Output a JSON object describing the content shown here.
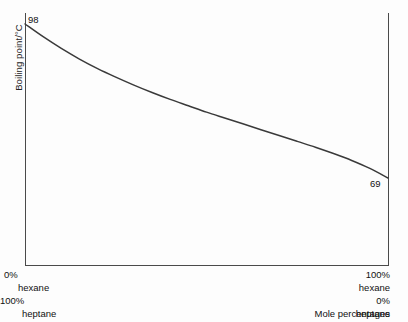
{
  "chart_data": {
    "type": "line",
    "title": "",
    "subtitle": "",
    "ylabel": "Boiling point/°C",
    "xlabel": "Mole percentages",
    "grid": false,
    "legend": null,
    "xlim": [
      0,
      100
    ],
    "ylim": [
      69,
      98
    ],
    "series": [
      {
        "name": "Boiling point of hexane-heptane mixture",
        "x": [
          0,
          5,
          10,
          15,
          20,
          25,
          30,
          35,
          40,
          45,
          50,
          55,
          60,
          65,
          70,
          75,
          80,
          85,
          90,
          95,
          100
        ],
        "y": [
          98.0,
          95.6,
          93.4,
          91.4,
          89.6,
          88.0,
          86.5,
          85.1,
          83.8,
          82.6,
          81.4,
          80.3,
          79.2,
          78.1,
          77.0,
          75.9,
          74.8,
          73.6,
          72.3,
          70.8,
          69.0
        ]
      }
    ],
    "annotations": [
      {
        "text": "98",
        "x": 0,
        "y": 98
      },
      {
        "text": "69",
        "x": 100,
        "y": 69
      }
    ],
    "axis_endpoint_labels": {
      "left": {
        "pct_first": "0%",
        "name_first": "hexane",
        "pct_second": "100%",
        "name_second": "heptane"
      },
      "right": {
        "pct_first": "100%",
        "name_first": "hexane",
        "pct_second": "0%",
        "name_second": "heptane"
      }
    },
    "colors": {
      "curve": "#3a3a3a",
      "axis": "#4a4a4a",
      "text": "#111111",
      "background": "#fdfdfd"
    }
  },
  "labels": {
    "y_axis_title": "Boiling point/°C",
    "x_axis_caption": "Mole percentages",
    "start_value": "98",
    "end_value": "69",
    "left_pct_top": "0%",
    "left_name_top": "hexane",
    "left_pct_bottom": "100%",
    "left_name_bottom": "heptane",
    "right_pct_top": "100%",
    "right_name_top": "hexane",
    "right_pct_bottom": "0%",
    "right_name_bottom": "heptane"
  }
}
